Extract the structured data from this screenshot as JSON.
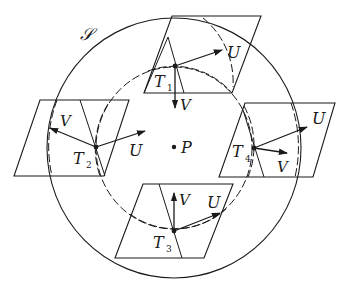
{
  "diagram": {
    "surface_label": "𝒮",
    "center_label": "P",
    "outer_circle": {
      "cx": 174,
      "cy": 148,
      "rx": 127,
      "ry": 130,
      "style": "solid"
    },
    "inner_circle": {
      "cx": 174,
      "cy": 148,
      "rx": 78,
      "ry": 81,
      "style": "dashed"
    },
    "center_point": {
      "x": 174,
      "y": 147
    },
    "tangent_planes": [
      {
        "label": "T",
        "sub": "1",
        "polygon": "172,16 261,16 232,93 144,93",
        "inner_line": [
          168,
          37,
          184,
          93
        ],
        "point": [
          175,
          66
        ],
        "U": {
          "label": "U",
          "to": [
            222,
            50
          ]
        },
        "V": {
          "label": "V",
          "to": [
            175,
            108
          ]
        }
      },
      {
        "label": "T",
        "sub": "2",
        "polygon": "40,100 129,100 104,176 14,176",
        "inner_line": [
          80,
          100,
          105,
          176
        ],
        "point": [
          96,
          147
        ],
        "U": {
          "label": "U",
          "to": [
            145,
            131
          ]
        },
        "V": {
          "label": "V",
          "to": [
            50,
            128
          ]
        }
      },
      {
        "label": "T",
        "sub": "3",
        "polygon": "143,184 233,184 204,258 115,258",
        "inner_line": [
          159,
          184,
          182,
          258
        ],
        "point": [
          174,
          231
        ],
        "U": {
          "label": "U",
          "to": [
            220,
            213
          ]
        },
        "V": {
          "label": "V",
          "to": [
            174,
            193
          ]
        }
      },
      {
        "label": "T",
        "sub": "4",
        "polygon": "245,103 335,103 313,177 219,177",
        "inner_line": [
          243,
          110,
          264,
          177
        ],
        "point": [
          254,
          148
        ],
        "U": {
          "label": "U",
          "to": [
            307,
            127
          ]
        },
        "V": {
          "label": "V",
          "to": [
            287,
            153
          ]
        }
      }
    ],
    "colors": {
      "ink": "#1a1a1a",
      "background": "#ffffff"
    }
  }
}
